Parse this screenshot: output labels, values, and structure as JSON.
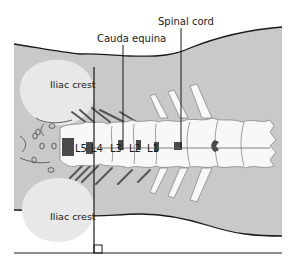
{
  "diagram": {
    "labels": {
      "spinal_cord": "Spinal cord",
      "cauda_equina": "Cauda equina",
      "iliac_crest_top": "Iliac crest",
      "iliac_crest_bottom": "Iliac crest",
      "L5": "L5",
      "L4": "L4",
      "L3": "L3",
      "L2": "L2",
      "L1": "L1"
    },
    "colors": {
      "body_fill": "#c9c9c9",
      "iliac_fill": "#e6e6e6",
      "bone_fill": "#f8f8f8",
      "dark": "#4a4a4a",
      "line": "#1a1a1a",
      "background": "#ffffff"
    }
  }
}
